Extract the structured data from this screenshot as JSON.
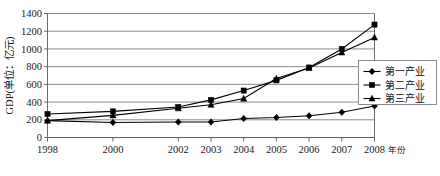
{
  "chart_data": {
    "type": "line",
    "title": "",
    "xlabel": "年份",
    "ylabel": "GDP(单位：亿元)",
    "x_unit_label": "年份",
    "categories": [
      "1998",
      "2000",
      "2002",
      "2003",
      "2004",
      "2005",
      "2006",
      "2007",
      "2008"
    ],
    "x_positions": [
      1998,
      2000,
      2002,
      2003,
      2004,
      2005,
      2006,
      2007,
      2008
    ],
    "ylim": [
      0,
      1400
    ],
    "yticks": [
      0,
      200,
      400,
      600,
      800,
      1000,
      1200,
      1400
    ],
    "ytick_labels": [
      "0",
      "200",
      "400",
      "600",
      "800",
      "1000",
      "1200",
      "1400"
    ],
    "grid": true,
    "legend_position": "right",
    "series": [
      {
        "name": "第一产业",
        "marker": "diamond",
        "values": [
          190,
          170,
          175,
          175,
          215,
          225,
          245,
          285,
          355
        ]
      },
      {
        "name": "第二产业",
        "marker": "square",
        "values": [
          265,
          295,
          345,
          425,
          530,
          645,
          790,
          1000,
          1275
        ]
      },
      {
        "name": "第三产业",
        "marker": "triangle",
        "values": [
          190,
          250,
          330,
          370,
          440,
          665,
          785,
          960,
          1130
        ]
      }
    ]
  },
  "legend": {
    "items": [
      {
        "label": "第一产业",
        "marker": "diamond-marker"
      },
      {
        "label": "第二产业",
        "marker": "square-marker"
      },
      {
        "label": "第三产业",
        "marker": "triangle-marker"
      }
    ]
  },
  "axes": {
    "y_axis_title": "GDP(单位：亿元)",
    "x_axis_unit": "年份"
  },
  "colors": {
    "series": "#000000",
    "grid": "#7d7d7d",
    "axis": "#5a5a5a",
    "background": "#ffffff",
    "text": "#1a1a1a"
  }
}
